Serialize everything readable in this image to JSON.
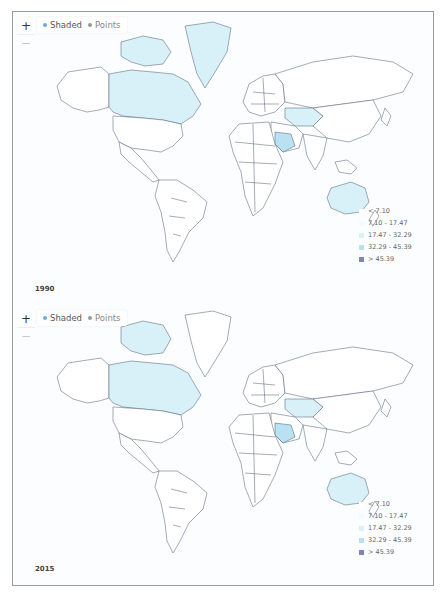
{
  "colors": {
    "ocean": "#fbfdfe",
    "land": "#ffffff",
    "border": "#4a5870",
    "shade_1": "#ffffff",
    "shade_2": "#f4fbfd",
    "shade_3": "#d8f0f8",
    "shade_4": "#b8e1f2",
    "shade_5": "#7e85b8",
    "frame": "#9a9a9a"
  },
  "panels": [
    {
      "year": "1990",
      "controls": {
        "zoom_in": "+",
        "zoom_out": "−"
      },
      "layer_toggle": {
        "options": [
          {
            "label": "Shaded",
            "active": true,
            "dot_color": "#6fa8dc"
          },
          {
            "label": "Points",
            "active": false,
            "dot_color": "#999999"
          }
        ]
      },
      "shaded_regions": [
        "Canada",
        "Greenland",
        "Kazakhstan",
        "Saudi Arabia",
        "Australia"
      ],
      "legend": [
        {
          "label": "< 7.10",
          "color": "#ffffff"
        },
        {
          "label": "7.10 - 17.47",
          "color": "#f4fbfd"
        },
        {
          "label": "17.47 - 32.29",
          "color": "#d8f0f8"
        },
        {
          "label": "32.29 - 45.39",
          "color": "#b8e1f2"
        },
        {
          "label": "> 45.39",
          "color": "#7e85b8"
        }
      ]
    },
    {
      "year": "2015",
      "controls": {
        "zoom_in": "+",
        "zoom_out": "−"
      },
      "layer_toggle": {
        "options": [
          {
            "label": "Shaded",
            "active": true,
            "dot_color": "#6fa8dc"
          },
          {
            "label": "Points",
            "active": false,
            "dot_color": "#999999"
          }
        ]
      },
      "shaded_regions": [
        "Canada",
        "Canadian Arctic Archipelago",
        "Kazakhstan",
        "Saudi Arabia",
        "Australia"
      ],
      "legend": [
        {
          "label": "< 7.10",
          "color": "#ffffff"
        },
        {
          "label": "7.10 - 17.47",
          "color": "#f4fbfd"
        },
        {
          "label": "17.47 - 32.29",
          "color": "#d8f0f8"
        },
        {
          "label": "32.29 - 45.39",
          "color": "#b8e1f2"
        },
        {
          "label": "> 45.39",
          "color": "#7e85b8"
        }
      ]
    }
  ]
}
